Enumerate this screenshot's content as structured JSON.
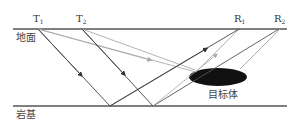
{
  "labels": {
    "t1": {
      "main": "T",
      "sub": "1"
    },
    "t2": {
      "main": "T",
      "sub": "2"
    },
    "r1": {
      "main": "R",
      "sub": "1"
    },
    "r2": {
      "main": "R",
      "sub": "2"
    },
    "ground": "地面",
    "bedrock": "岩基",
    "target": "目标体"
  },
  "colors": {
    "surface_line": "#555555",
    "direct_ray": "#444444",
    "target_ray": "#aaaaaa",
    "target_body": "#111111"
  }
}
